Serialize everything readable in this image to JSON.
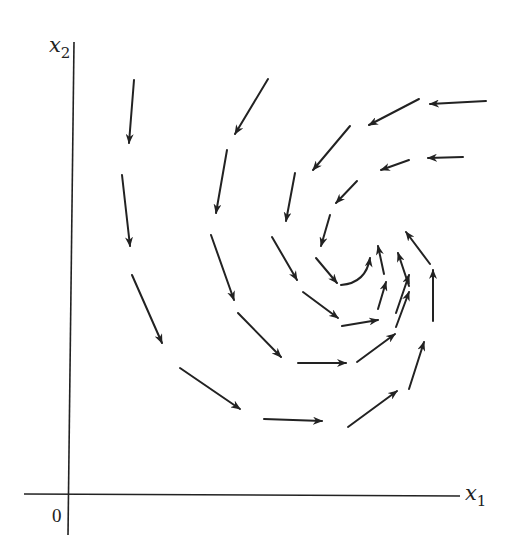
{
  "diagram": {
    "type": "phase-portrait",
    "colors": {
      "ink": "#222222",
      "background": "#ffffff"
    },
    "axes": {
      "x_label": "x",
      "x_subscript": "1",
      "y_label": "x",
      "y_subscript": "2",
      "origin_label": "0",
      "origin_px": [
        70,
        496
      ],
      "x_axis_px": {
        "from": [
          24,
          494
        ],
        "to": [
          460,
          496
        ]
      },
      "y_axis_px": {
        "from": [
          74,
          42
        ],
        "to": [
          68,
          535
        ]
      }
    },
    "arrows": [
      {
        "tail": [
          134,
          80
        ],
        "head": [
          129,
          143
        ]
      },
      {
        "tail": [
          122,
          175
        ],
        "head": [
          130,
          246
        ]
      },
      {
        "tail": [
          132,
          275
        ],
        "head": [
          162,
          343
        ]
      },
      {
        "tail": [
          180,
          368
        ],
        "head": [
          240,
          409
        ]
      },
      {
        "tail": [
          264,
          419
        ],
        "head": [
          322,
          421
        ]
      },
      {
        "tail": [
          348,
          427
        ],
        "head": [
          397,
          391
        ]
      },
      {
        "tail": [
          409,
          389
        ],
        "head": [
          424,
          342
        ]
      },
      {
        "tail": [
          433,
          321
        ],
        "head": [
          433,
          270
        ]
      },
      {
        "tail": [
          430,
          264
        ],
        "head": [
          406,
          232
        ]
      },
      {
        "tail": [
          486,
          101
        ],
        "head": [
          430,
          104
        ]
      },
      {
        "tail": [
          419,
          99
        ],
        "head": [
          369,
          125
        ]
      },
      {
        "tail": [
          350,
          126
        ],
        "head": [
          313,
          170
        ]
      },
      {
        "tail": [
          295,
          173
        ],
        "head": [
          286,
          221
        ]
      },
      {
        "tail": [
          268,
          79
        ],
        "head": [
          235,
          134
        ]
      },
      {
        "tail": [
          227,
          150
        ],
        "head": [
          216,
          213
        ]
      },
      {
        "tail": [
          211,
          235
        ],
        "head": [
          234,
          300
        ]
      },
      {
        "tail": [
          238,
          313
        ],
        "head": [
          281,
          357
        ]
      },
      {
        "tail": [
          298,
          363
        ],
        "head": [
          346,
          363
        ]
      },
      {
        "tail": [
          357,
          362
        ],
        "head": [
          395,
          334
        ]
      },
      {
        "tail": [
          396,
          327
        ],
        "head": [
          409,
          292
        ]
      },
      {
        "tail": [
          409,
          286
        ],
        "head": [
          398,
          253
        ]
      },
      {
        "tail": [
          463,
          157
        ],
        "head": [
          428,
          158
        ]
      },
      {
        "tail": [
          409,
          160
        ],
        "head": [
          381,
          170
        ]
      },
      {
        "tail": [
          357,
          181
        ],
        "head": [
          336,
          203
        ]
      },
      {
        "tail": [
          330,
          215
        ],
        "head": [
          321,
          246
        ]
      },
      {
        "tail": [
          272,
          237
        ],
        "head": [
          297,
          280
        ]
      },
      {
        "tail": [
          316,
          258
        ],
        "head": [
          337,
          283
        ]
      },
      {
        "tail": [
          303,
          292
        ],
        "head": [
          338,
          318
        ]
      },
      {
        "tail": [
          342,
          326
        ],
        "head": [
          378,
          320
        ]
      },
      {
        "tail": [
          341,
          285
        ],
        "head": [
          370,
          258
        ],
        "curved": true,
        "control": [
          366,
          283
        ]
      },
      {
        "tail": [
          384,
          274
        ],
        "head": [
          378,
          246
        ]
      },
      {
        "tail": [
          378,
          309
        ],
        "head": [
          386,
          282
        ]
      },
      {
        "tail": [
          396,
          313
        ],
        "head": [
          409,
          275
        ]
      }
    ]
  }
}
